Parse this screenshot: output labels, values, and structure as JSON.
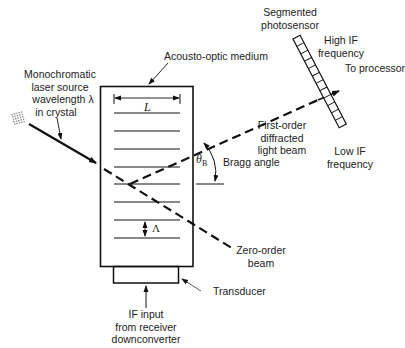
{
  "diagram": {
    "labels": {
      "acousto_optic_medium": "Acousto-optic medium",
      "laser_source": [
        "Monochromatic",
        "laser source",
        "wavelength λ",
        "in crystal"
      ],
      "segmented_photosensor": [
        "Segmented",
        "photosensor"
      ],
      "high_if": [
        "High IF",
        "frequency"
      ],
      "to_processor": "To processor",
      "first_order_beam": [
        "First-order",
        "diffracted",
        "light beam"
      ],
      "low_if": [
        "Low IF",
        "frequency"
      ],
      "bragg_angle": "Bragg angle",
      "theta_b_symbol": "θ",
      "theta_b_subscript": "B",
      "zero_order_beam": [
        "Zero-order",
        "beam"
      ],
      "transducer": "Transducer",
      "if_input": [
        "IF input",
        "from receiver",
        "downconverter"
      ],
      "length_symbol": "L",
      "wavelength_spacing_symbol": "Λ"
    },
    "components": [
      {
        "name": "laser-source",
        "shape": "hatched square"
      },
      {
        "name": "acousto-optic-medium",
        "shape": "rectangle",
        "grating_lines": 8
      },
      {
        "name": "transducer",
        "shape": "rectangle"
      },
      {
        "name": "segmented-photosensor",
        "shape": "tilted segmented bar",
        "segments": 12
      }
    ],
    "colors": {
      "line": "#111111",
      "text": "#222222",
      "background": "#ffffff"
    }
  }
}
